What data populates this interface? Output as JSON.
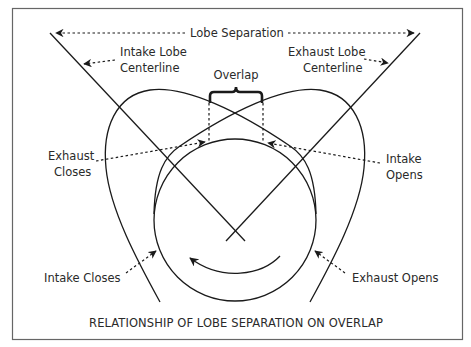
{
  "figure": {
    "caption": "RELATIONSHIP OF LOBE SEPARATION ON OVERLAP",
    "labels": {
      "lobe_separation": "Lobe Separation",
      "intake_centerline_1": "Intake Lobe",
      "intake_centerline_2": "Centerline",
      "exhaust_centerline_1": "Exhaust Lobe",
      "exhaust_centerline_2": "Centerline",
      "overlap": "Overlap",
      "exhaust_closes_1": "Exhaust",
      "exhaust_closes_2": "Closes",
      "intake_opens_1": "Intake",
      "intake_opens_2": "Opens",
      "intake_closes": "Intake Closes",
      "exhaust_opens": "Exhaust Opens"
    },
    "elements": {
      "base_circle": "base-circle",
      "intake_lobe": "intake-lobe-profile",
      "exhaust_lobe": "exhaust-lobe-profile",
      "rotation_arrow": "counterclockwise-rotation-arrow",
      "overlap_bracket": "curly-brace"
    },
    "colors": {
      "line": "#1a1a1a",
      "text": "#2a2a2a",
      "border": "#666666",
      "background": "#ffffff"
    }
  }
}
